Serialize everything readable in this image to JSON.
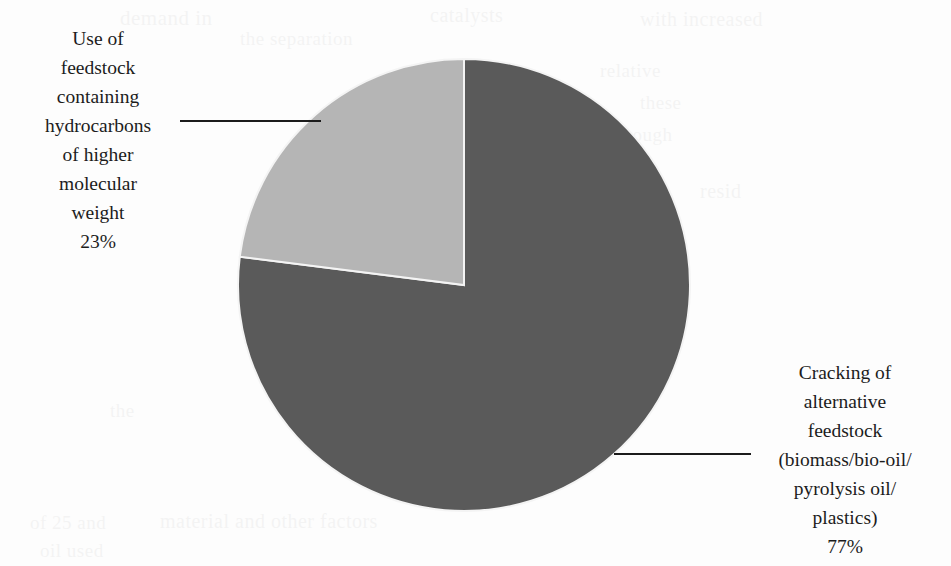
{
  "chart_data": {
    "type": "pie",
    "title": "",
    "subtitle": "",
    "xlabel": "",
    "ylabel": "",
    "grid": false,
    "legend_position": "none",
    "label_placement": "outside-with-leader-lines",
    "start_angle_deg": 0,
    "start_angle_note": "first slice boundary at 12 o'clock",
    "direction": "clockwise",
    "categories": [
      "Cracking of alternative feedstock (biomass/bio-oil/pyrolysis oil/plastics)",
      "Use of feedstock containing hydrocarbons of higher molecular weight"
    ],
    "values": [
      77,
      23
    ],
    "value_unit": "%",
    "total": 100,
    "slices": [
      {
        "name": "Cracking of alternative feedstock (biomass/bio-oil/pyrolysis oil/plastics)",
        "value": 77,
        "percent_text": "77%",
        "color": "#5a5a5a",
        "sweep_deg": 277.2,
        "start_deg": 0,
        "end_deg": 277.2
      },
      {
        "name": "Use of feedstock containing hydrocarbons of higher molecular weight",
        "value": 23,
        "percent_text": "23%",
        "color": "#b5b5b5",
        "sweep_deg": 82.8,
        "start_deg": 277.2,
        "end_deg": 360
      }
    ]
  },
  "geometry": {
    "center_x": 464,
    "center_y": 285,
    "radius": 226,
    "separator_color": "#f4f4f4"
  },
  "labels": {
    "light_slice": {
      "lines": [
        "Use of",
        "feedstock",
        "containing",
        "hydrocarbons",
        "of higher",
        "molecular",
        "weight",
        "23%"
      ]
    },
    "dark_slice": {
      "lines": [
        "Cracking of",
        "alternative",
        "feedstock",
        "(biomass/bio-oil/",
        "pyrolysis oil/",
        "plastics)",
        "77%"
      ]
    }
  },
  "colors": {
    "background": "#fdfdfd",
    "dark_slice": "#5a5a5a",
    "light_slice": "#b5b5b5",
    "text": "#1c1c1c",
    "leader_line": "#1c1c1c"
  },
  "scan_artifacts": {
    "note": "faint bleed-through text from reverse of scanned page; illegible",
    "ghosts": [
      {
        "text": "demand in",
        "x": 120,
        "y": 6,
        "size": 21
      },
      {
        "text": "the separation",
        "x": 240,
        "y": 28,
        "size": 19
      },
      {
        "text": "catalysts",
        "x": 430,
        "y": 4,
        "size": 20
      },
      {
        "text": "with increased",
        "x": 640,
        "y": 8,
        "size": 20
      },
      {
        "text": "relative",
        "x": 600,
        "y": 60,
        "size": 19
      },
      {
        "text": "these",
        "x": 640,
        "y": 92,
        "size": 19
      },
      {
        "text": "through",
        "x": 610,
        "y": 124,
        "size": 19
      },
      {
        "text": "resid",
        "x": 700,
        "y": 180,
        "size": 20
      },
      {
        "text": "the",
        "x": 110,
        "y": 400,
        "size": 19
      },
      {
        "text": "significant",
        "x": 430,
        "y": 480,
        "size": 19
      },
      {
        "text": "material and other factors",
        "x": 160,
        "y": 510,
        "size": 20
      },
      {
        "text": "oil used",
        "x": 40,
        "y": 540,
        "size": 19
      },
      {
        "text": "of 25 and",
        "x": 30,
        "y": 512,
        "size": 19
      }
    ]
  }
}
